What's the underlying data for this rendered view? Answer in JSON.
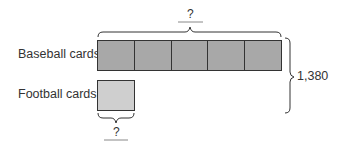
{
  "diagram": {
    "type": "tape-diagram",
    "rows": [
      {
        "label": "Baseball cards",
        "units": 5,
        "color": "#a8a8a8"
      },
      {
        "label": "Football cards",
        "units": 1,
        "color": "#cfcfcf"
      }
    ],
    "top_brace_label": "?",
    "bottom_brace_label": "?",
    "total_label": "1,380"
  }
}
